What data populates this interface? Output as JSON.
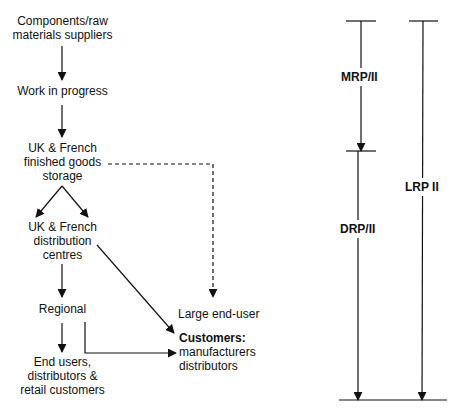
{
  "flow": {
    "suppliers": [
      "Components/raw",
      "materials suppliers"
    ],
    "wip": "Work in progress",
    "storage": [
      "UK & French",
      "finished goods",
      "storage"
    ],
    "distribution": [
      "UK & French",
      "distribution",
      "centres"
    ],
    "regional": "Regional",
    "end_users": [
      "End users,",
      "distributors &",
      "retail customers"
    ],
    "large_end_user": "Large end-user",
    "customers": {
      "title": "Customers:",
      "lines": [
        "manufacturers",
        "distributors"
      ]
    }
  },
  "scopes": {
    "mrp": "MRP/II",
    "drp": "DRP/II",
    "lrp": "LRP II"
  },
  "colors": {
    "line": "#111111",
    "background": "#ffffff"
  }
}
